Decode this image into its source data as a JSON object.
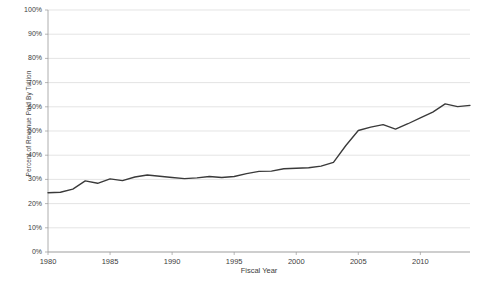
{
  "chart_data": {
    "type": "line",
    "title": "",
    "xlabel": "Fiscal Year",
    "ylabel": "Percent of Revenue Paid By Tuition",
    "xlim": [
      1980,
      2014
    ],
    "ylim": [
      0,
      100
    ],
    "grid": true,
    "legend": "none",
    "line_color": "#3a3a3a",
    "grid_color": "#d9d9d9",
    "axis_color": "#9a9a9a",
    "background_color": "#ffffff",
    "x_ticks": [
      "1980",
      "1985",
      "1990",
      "1995",
      "2000",
      "2005",
      "2010"
    ],
    "x_tick_values": [
      1980,
      1985,
      1990,
      1995,
      2000,
      2005,
      2010
    ],
    "y_ticks": [
      "0%",
      "10%",
      "20%",
      "30%",
      "40%",
      "50%",
      "60%",
      "70%",
      "80%",
      "90%",
      "100%"
    ],
    "y_tick_values": [
      0,
      10,
      20,
      30,
      40,
      50,
      60,
      70,
      80,
      90,
      100
    ],
    "x": [
      1980,
      1981,
      1982,
      1983,
      1984,
      1985,
      1986,
      1987,
      1988,
      1989,
      1990,
      1991,
      1992,
      1993,
      1994,
      1995,
      1996,
      1997,
      1998,
      1999,
      2000,
      2001,
      2002,
      2003,
      2004,
      2005,
      2006,
      2007,
      2008,
      2009,
      2010,
      2011,
      2012,
      2013,
      2014
    ],
    "values": [
      24.5,
      24.7,
      26.0,
      29.4,
      28.4,
      30.2,
      29.5,
      31.0,
      31.8,
      31.3,
      30.8,
      30.3,
      30.6,
      31.2,
      30.8,
      31.2,
      32.4,
      33.3,
      33.4,
      34.4,
      34.6,
      34.8,
      35.5,
      37.0,
      44.0,
      50.2,
      51.6,
      52.6,
      50.8,
      53.0,
      55.4,
      57.8,
      61.2,
      60.1,
      60.6
    ],
    "series_name": "Percent of Revenue Paid By Tuition"
  }
}
